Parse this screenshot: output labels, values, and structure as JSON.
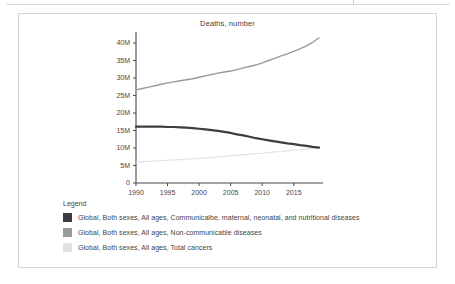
{
  "card": {
    "title": "Deaths, number"
  },
  "legend": {
    "title": "Legend",
    "items": [
      {
        "label": "Global, Both sexes, All ages, Communicalbe, maternal, neonatal, and nutritional diseases",
        "color": "#3d3d3d"
      },
      {
        "label": "Global, Both sexes, All ages, Non-communicable diseases",
        "color": "#9a9a9a"
      },
      {
        "label": "Global, Both sexes, All ages, Total cancers",
        "color": "#e2e2e2"
      }
    ]
  },
  "chart_data": {
    "type": "line",
    "title": "Deaths, number",
    "xlabel": "",
    "ylabel": "",
    "xlim": [
      1990,
      2019
    ],
    "ylim": [
      0,
      42
    ],
    "units": "millions",
    "grid": false,
    "legend_position": "bottom-left",
    "xticks": [
      "1990",
      "1995",
      "2000",
      "2005",
      "2010",
      "2015"
    ],
    "xtick_values": [
      1990,
      1995,
      2000,
      2005,
      2010,
      2015
    ],
    "yticks": [
      "0",
      "5M",
      "10M",
      "15M",
      "20M",
      "25M",
      "30M",
      "35M",
      "40M"
    ],
    "ytick_values": [
      0,
      5,
      10,
      15,
      20,
      25,
      30,
      35,
      40
    ],
    "x": [
      1990,
      1991,
      1992,
      1993,
      1994,
      1995,
      1996,
      1997,
      1998,
      1999,
      2000,
      2001,
      2002,
      2003,
      2004,
      2005,
      2006,
      2007,
      2008,
      2009,
      2010,
      2011,
      2012,
      2013,
      2014,
      2015,
      2016,
      2017,
      2018,
      2019
    ],
    "series": [
      {
        "name": "Global, Both sexes, All ages, Communicalbe, maternal, neonatal, and nutritional diseases",
        "color": "#3d3d3d",
        "width": 2.2,
        "values": [
          16.1,
          16.1,
          16.1,
          16.1,
          16.1,
          16.0,
          16.0,
          15.9,
          15.8,
          15.7,
          15.5,
          15.3,
          15.1,
          14.9,
          14.6,
          14.3,
          13.9,
          13.6,
          13.2,
          12.8,
          12.5,
          12.2,
          11.9,
          11.6,
          11.3,
          11.1,
          10.8,
          10.6,
          10.3,
          10.1
        ]
      },
      {
        "name": "Global, Both sexes, All ages, Non-communicable diseases",
        "color": "#9a9a9a",
        "width": 1.4,
        "values": [
          26.6,
          27.0,
          27.4,
          27.8,
          28.2,
          28.6,
          28.9,
          29.2,
          29.5,
          29.8,
          30.2,
          30.6,
          31.0,
          31.4,
          31.7,
          32.0,
          32.4,
          32.9,
          33.3,
          33.7,
          34.3,
          35.0,
          35.6,
          36.3,
          36.9,
          37.6,
          38.3,
          39.2,
          40.2,
          41.5
        ]
      },
      {
        "name": "Global, Both sexes, All ages, Total cancers",
        "color": "#e2e2e2",
        "width": 1.2,
        "values": [
          6.0,
          6.1,
          6.2,
          6.3,
          6.4,
          6.5,
          6.6,
          6.7,
          6.8,
          6.9,
          7.0,
          7.2,
          7.3,
          7.5,
          7.6,
          7.8,
          7.9,
          8.1,
          8.2,
          8.4,
          8.5,
          8.7,
          8.9,
          9.0,
          9.2,
          9.4,
          9.5,
          9.7,
          9.9,
          10.1
        ]
      }
    ]
  }
}
